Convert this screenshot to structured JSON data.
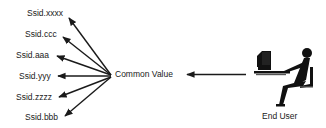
{
  "diagram": {
    "targets": [
      {
        "label": "Ssid.xxxx",
        "x": 27,
        "y": 9
      },
      {
        "label": "Ssid.ccc",
        "x": 25,
        "y": 30
      },
      {
        "label": "Ssid.aaa",
        "x": 16,
        "y": 51
      },
      {
        "label": "Ssid.yyy",
        "x": 19,
        "y": 72
      },
      {
        "label": "Ssid.zzzz",
        "x": 16,
        "y": 93
      },
      {
        "label": "Ssid.bbb",
        "x": 25,
        "y": 113
      }
    ],
    "hub_label": "Common Value",
    "actor_label": "End User",
    "actor_icon": "user-at-computer-icon",
    "line_color": "#1a1a1a"
  }
}
